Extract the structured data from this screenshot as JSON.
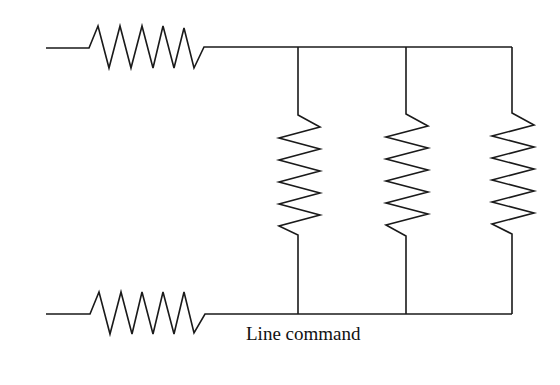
{
  "diagram": {
    "type": "circuit-schematic",
    "caption": "Line command",
    "stroke_color": "#1a1a1a",
    "components": [
      {
        "id": "R-top-series",
        "kind": "resistor",
        "orientation": "horizontal",
        "position": "top-left"
      },
      {
        "id": "R-bottom-series",
        "kind": "resistor",
        "orientation": "horizontal",
        "position": "bottom-left"
      },
      {
        "id": "R-parallel-1",
        "kind": "resistor",
        "orientation": "vertical",
        "position": "branch-1"
      },
      {
        "id": "R-parallel-2",
        "kind": "resistor",
        "orientation": "vertical",
        "position": "branch-2"
      },
      {
        "id": "R-parallel-3",
        "kind": "resistor",
        "orientation": "vertical",
        "position": "branch-3"
      }
    ]
  }
}
